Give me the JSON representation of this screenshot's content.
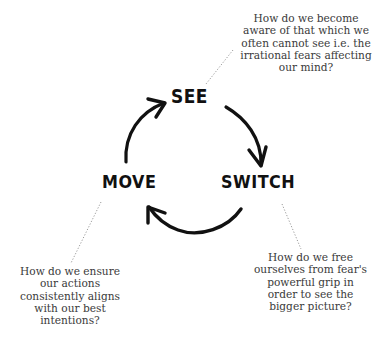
{
  "diagram": {
    "type": "cycle",
    "stages": [
      {
        "id": "see",
        "label": "SEE"
      },
      {
        "id": "switch",
        "label": "SWITCH"
      },
      {
        "id": "move",
        "label": "MOVE"
      }
    ],
    "flow": [
      "SEE -> SWITCH",
      "SWITCH -> MOVE",
      "MOVE -> SEE"
    ],
    "questions": {
      "see": {
        "lines": [
          "How do we become",
          "aware of that which we",
          "often cannot see i.e. the",
          "irrational fears affecting",
          "our mind?"
        ]
      },
      "switch": {
        "lines": [
          "How do we free",
          "ourselves from fear's",
          "powerful  grip in",
          "order to see the",
          "bigger picture?"
        ]
      },
      "move": {
        "lines": [
          "How do we ensure",
          "our actions",
          "consistently aligns",
          "with our best",
          "intentions?"
        ]
      }
    },
    "colors": {
      "ink": "#111111",
      "text": "#3a3a3a",
      "dotted": "#9a9a9a",
      "background": "#ffffff"
    }
  }
}
